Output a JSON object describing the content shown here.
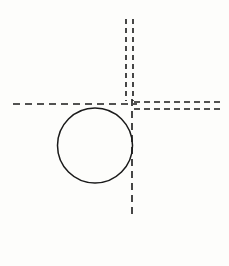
{
  "figure": {
    "canvas": {
      "width": 229,
      "height": 266,
      "background_color": "#fdfdfb"
    },
    "stroke_color": "#1a1a1a",
    "dash_color": "#1a1a1a"
  },
  "chart_data": {
    "type": "diagram",
    "xlabel": "",
    "ylabel": "",
    "xlim": [
      0,
      229
    ],
    "ylim": [
      0,
      266
    ],
    "grid": false,
    "legend": "none",
    "shapes": [
      {
        "name": "circle",
        "kind": "circle",
        "cx": 95,
        "cy": 145.5,
        "r": 37.5,
        "stroke": "#1a1a1a",
        "stroke_width": 1.5,
        "fill": "none",
        "dash": "solid"
      },
      {
        "name": "vertical-centerline-upper-left",
        "kind": "line",
        "x1": 126,
        "y1": 19,
        "x2": 126,
        "y2": 101,
        "stroke": "#1a1a1a",
        "stroke_width": 1.6,
        "dash": "5,4"
      },
      {
        "name": "vertical-centerline-upper-right",
        "kind": "line",
        "x1": 133,
        "y1": 19,
        "x2": 133,
        "y2": 101,
        "stroke": "#1a1a1a",
        "stroke_width": 1.6,
        "dash": "5,4"
      },
      {
        "name": "vertical-centerline-lower",
        "kind": "line",
        "x1": 132,
        "y1": 99,
        "x2": 132,
        "y2": 219,
        "stroke": "#1a1a1a",
        "stroke_width": 1.6,
        "dash": "7,5"
      },
      {
        "name": "horizontal-centerline-left",
        "kind": "line",
        "x1": 13,
        "y1": 104,
        "x2": 137,
        "y2": 104,
        "stroke": "#1a1a1a",
        "stroke_width": 1.6,
        "dash": "7,5"
      },
      {
        "name": "horizontal-centerline-right-upper",
        "kind": "line",
        "x1": 134,
        "y1": 102,
        "x2": 222,
        "y2": 102,
        "stroke": "#1a1a1a",
        "stroke_width": 1.6,
        "dash": "6,4"
      },
      {
        "name": "horizontal-centerline-right-lower",
        "kind": "line",
        "x1": 134,
        "y1": 109,
        "x2": 222,
        "y2": 109,
        "stroke": "#1a1a1a",
        "stroke_width": 1.6,
        "dash": "6,4"
      }
    ],
    "intersection_point": {
      "name": "centerline-crossing",
      "x": 132,
      "y": 104
    },
    "annotations": [],
    "tick_labels": [],
    "values": []
  }
}
